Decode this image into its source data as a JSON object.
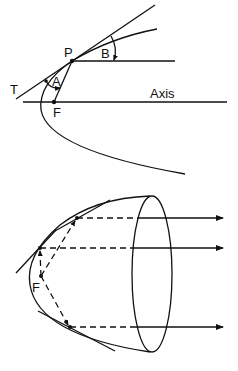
{
  "figure_top": {
    "description": "Parabola with tangent at P showing equal angles A and B (reflection property)",
    "labels": {
      "tangent": "T",
      "point": "P",
      "angle_a": "A",
      "angle_b": "B",
      "focus": "F",
      "axis": "Axis"
    }
  },
  "figure_bottom": {
    "description": "Paraboloid reflector: rays from focus F reflect into parallel beams",
    "labels": {
      "focus": "F"
    },
    "ray_count": 3
  },
  "colors": {
    "ink": "#111111",
    "background": "#ffffff"
  }
}
